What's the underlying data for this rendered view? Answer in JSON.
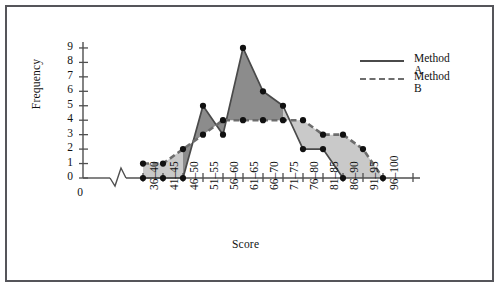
{
  "chart_data": {
    "type": "line",
    "title": "",
    "xlabel": "Score",
    "ylabel": "Frequency",
    "categories": [
      "36-40",
      "41-45",
      "46-50",
      "51-55",
      "56-60",
      "61-65",
      "66-70",
      "71-75",
      "76-80",
      "81-85",
      "86-90",
      "91-95",
      "96-100"
    ],
    "x_tick_labels": [
      "36–40",
      "41–45",
      "46–50",
      "51–55",
      "56–60",
      "61–65",
      "66–70",
      "71–75",
      "76–80",
      "81–85",
      "86–90",
      "91–95",
      "96–100"
    ],
    "y_tick_labels": [
      "0",
      "1",
      "2",
      "3",
      "4",
      "5",
      "6",
      "7",
      "8",
      "9"
    ],
    "ylim": [
      0,
      9
    ],
    "ylim_label_min": "0",
    "ylim_label_max": "9",
    "grid": false,
    "axis_break": true,
    "origin_label": "0",
    "legend_position": "top-right",
    "series": [
      {
        "name": "Method A",
        "style": "solid",
        "color": "#4a4a4a",
        "values": [
          0,
          0,
          0,
          5,
          3,
          9,
          6,
          5,
          2,
          2,
          0,
          null,
          null
        ]
      },
      {
        "name": "Method B",
        "style": "dashed",
        "color": "#6d6d6d",
        "values": [
          1,
          1,
          2,
          3,
          4,
          4,
          4,
          4,
          4,
          3,
          3,
          2,
          0
        ]
      }
    ],
    "fill_between": true,
    "fill_colors": [
      "#8c8c8c",
      "#c9c9c9"
    ],
    "marker": "filled-circle",
    "marker_color": "#111111"
  },
  "legend": {
    "items": [
      {
        "label": "Method A",
        "style": "solid"
      },
      {
        "label": "Method B",
        "style": "dashed"
      }
    ]
  }
}
